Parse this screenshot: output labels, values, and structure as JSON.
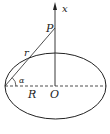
{
  "diagram": {
    "labels": {
      "axis": "x",
      "point": "P",
      "distance": "r",
      "angle": "α",
      "radius": "R",
      "origin": "O"
    },
    "colors": {
      "stroke": "#222222",
      "background": "#ffffff"
    }
  }
}
